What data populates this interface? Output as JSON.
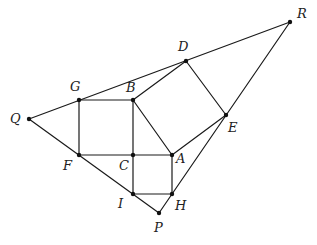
{
  "figure": {
    "type": "geometry",
    "points": [
      {
        "name": "R",
        "x": 290,
        "y": 22,
        "label": "R",
        "lx": 297,
        "ly": 18
      },
      {
        "name": "D",
        "x": 186,
        "y": 61,
        "label": "D",
        "lx": 178,
        "ly": 51
      },
      {
        "name": "G",
        "x": 79,
        "y": 100,
        "label": "G",
        "lx": 70,
        "ly": 91
      },
      {
        "name": "B",
        "x": 133,
        "y": 100,
        "label": "B",
        "lx": 126,
        "ly": 92
      },
      {
        "name": "Q",
        "x": 29,
        "y": 119,
        "label": "Q",
        "lx": 10,
        "ly": 123
      },
      {
        "name": "E",
        "x": 226,
        "y": 115,
        "label": "E",
        "lx": 228,
        "ly": 132
      },
      {
        "name": "F",
        "x": 79,
        "y": 155,
        "label": "F",
        "lx": 63,
        "ly": 170
      },
      {
        "name": "C",
        "x": 133,
        "y": 155,
        "label": "C",
        "lx": 119,
        "ly": 170
      },
      {
        "name": "A",
        "x": 172,
        "y": 155,
        "label": "A",
        "lx": 176,
        "ly": 163
      },
      {
        "name": "I",
        "x": 133,
        "y": 194,
        "label": "I",
        "lx": 118,
        "ly": 208
      },
      {
        "name": "H",
        "x": 172,
        "y": 194,
        "label": "H",
        "lx": 175,
        "ly": 210
      },
      {
        "name": "P",
        "x": 159,
        "y": 213,
        "label": "P",
        "lx": 154,
        "ly": 232
      }
    ],
    "segments": [
      [
        "Q",
        "R"
      ],
      [
        "R",
        "P"
      ],
      [
        "Q",
        "P"
      ],
      [
        "G",
        "B"
      ],
      [
        "G",
        "F"
      ],
      [
        "F",
        "A"
      ],
      [
        "B",
        "I"
      ],
      [
        "B",
        "D"
      ],
      [
        "D",
        "E"
      ],
      [
        "E",
        "A"
      ],
      [
        "A",
        "B"
      ],
      [
        "A",
        "H"
      ],
      [
        "I",
        "H"
      ]
    ]
  }
}
